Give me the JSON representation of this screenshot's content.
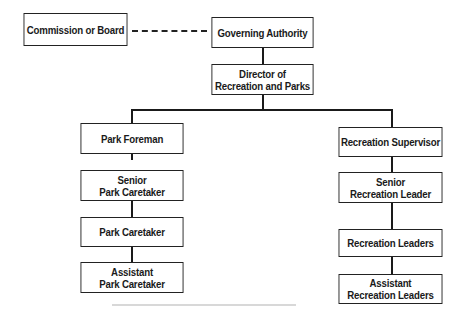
{
  "diagram": {
    "type": "organization-chart",
    "top": {
      "commission": "Commission or Board",
      "governing": "Governing Authority",
      "director": "Director of\nRecreation and Parks"
    },
    "left_branch": [
      "Park Foreman",
      "Senior\nPark Caretaker",
      "Park Caretaker",
      "Assistant\nPark Caretaker"
    ],
    "right_branch": [
      "Recreation Supervisor",
      "Senior\nRecreation Leader",
      "Recreation Leaders",
      "Assistant\nRecreation Leaders"
    ],
    "relationships": [
      {
        "from": "Commission or Board",
        "to": "Governing Authority",
        "style": "dashed"
      },
      {
        "from": "Governing Authority",
        "to": "Director of Recreation and Parks",
        "style": "solid"
      },
      {
        "from": "Director of Recreation and Parks",
        "to": "Park Foreman",
        "style": "solid"
      },
      {
        "from": "Director of Recreation and Parks",
        "to": "Recreation Supervisor",
        "style": "solid"
      },
      {
        "from": "Park Foreman",
        "to": "Senior Park Caretaker",
        "style": "solid"
      },
      {
        "from": "Senior Park Caretaker",
        "to": "Park Caretaker",
        "style": "solid"
      },
      {
        "from": "Park Caretaker",
        "to": "Assistant Park Caretaker",
        "style": "solid"
      },
      {
        "from": "Recreation Supervisor",
        "to": "Senior Recreation Leader",
        "style": "solid"
      },
      {
        "from": "Senior Recreation Leader",
        "to": "Recreation Leaders",
        "style": "solid"
      },
      {
        "from": "Recreation Leaders",
        "to": "Assistant Recreation Leaders",
        "style": "solid"
      }
    ],
    "colors": {
      "line": "#1a1a1a",
      "box_fill": "#ffffff",
      "text": "#1a1a1a"
    }
  }
}
